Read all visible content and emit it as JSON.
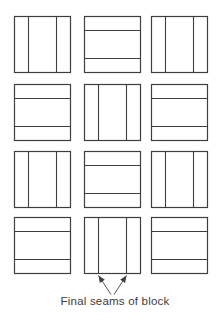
{
  "diagram": {
    "caption": "Final seams of block",
    "colors": {
      "line": "#3f3f3f",
      "text": "#3d3d3d",
      "background": "#ffffff"
    },
    "grid": {
      "rows": 4,
      "cols": 3,
      "block_pattern": [
        [
          "vertical",
          "horizontal",
          "vertical"
        ],
        [
          "horizontal",
          "vertical",
          "horizontal"
        ],
        [
          "vertical",
          "horizontal",
          "vertical"
        ],
        [
          "horizontal",
          "vertical",
          "horizontal"
        ]
      ],
      "seam_fractions": [
        0.25,
        0.75
      ]
    },
    "annotation": {
      "target_block": {
        "row": 4,
        "col": 2
      },
      "points_to": "vertical seams of bottom-middle block"
    }
  }
}
